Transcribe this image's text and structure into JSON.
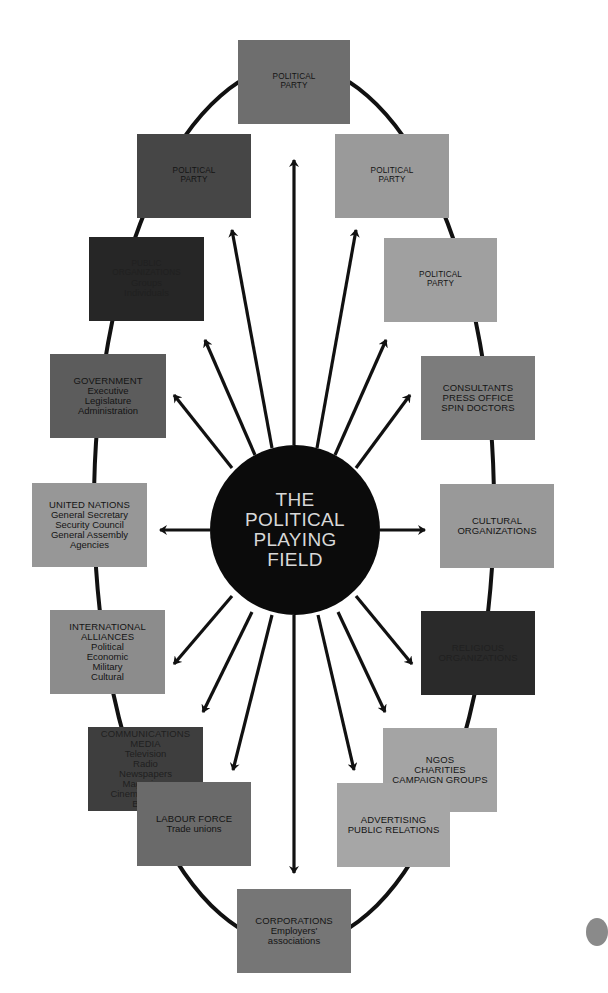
{
  "diagram": {
    "title_lines": [
      "THE",
      "POLITICAL",
      "PLAYING",
      "FIELD"
    ],
    "colors": {
      "background": "#ffffff",
      "hub": "#0b0b0b",
      "hub_text": "#d8d8d8",
      "connector": "#111111"
    },
    "nodes": [
      {
        "id": "political-party-top",
        "title": [
          "POLITICAL",
          "PARTY"
        ],
        "sub": [],
        "fill": "#6e6e6e",
        "x": 238,
        "y": 40,
        "w": 112,
        "h": 84,
        "small": true
      },
      {
        "id": "political-party-upper-left",
        "title": [
          "POLITICAL",
          "PARTY"
        ],
        "sub": [],
        "fill": "#464646",
        "x": 137,
        "y": 134,
        "w": 114,
        "h": 84,
        "small": true
      },
      {
        "id": "political-party-upper-right",
        "title": [
          "POLITICAL",
          "PARTY"
        ],
        "sub": [],
        "fill": "#9a9a9a",
        "x": 335,
        "y": 134,
        "w": 114,
        "h": 84,
        "small": true
      },
      {
        "id": "public-organizations",
        "title": [
          "PUBLIC",
          "ORGANIZATIONS"
        ],
        "sub": [
          "Groups",
          "Individuals"
        ],
        "fill": "#262626",
        "x": 89,
        "y": 237,
        "w": 115,
        "h": 84,
        "small": true,
        "dark": true
      },
      {
        "id": "political-party-right",
        "title": [
          "POLITICAL",
          "PARTY"
        ],
        "sub": [],
        "fill": "#a0a0a0",
        "x": 384,
        "y": 238,
        "w": 113,
        "h": 84,
        "small": true
      },
      {
        "id": "government",
        "title": [
          "GOVERNMENT"
        ],
        "sub": [
          "Executive",
          "Legislature",
          "Administration"
        ],
        "fill": "#5c5c5c",
        "x": 50,
        "y": 354,
        "w": 116,
        "h": 84
      },
      {
        "id": "consultants",
        "title": [
          "CONSULTANTS",
          "PRESS OFFICE",
          "SPIN DOCTORS"
        ],
        "sub": [],
        "fill": "#7c7c7c",
        "x": 421,
        "y": 356,
        "w": 114,
        "h": 84
      },
      {
        "id": "united-nations",
        "title": [
          "UNITED NATIONS"
        ],
        "sub": [
          "General Secretary",
          "Security Council",
          "General Assembly",
          "Agencies"
        ],
        "fill": "#979797",
        "x": 32,
        "y": 483,
        "w": 115,
        "h": 84
      },
      {
        "id": "cultural-organizations",
        "title": [
          "CULTURAL",
          "ORGANIZATIONS"
        ],
        "sub": [],
        "fill": "#999999",
        "x": 440,
        "y": 484,
        "w": 114,
        "h": 84
      },
      {
        "id": "international-alliances",
        "title": [
          "INTERNATIONAL",
          "ALLIANCES"
        ],
        "sub": [
          "Political",
          "Economic",
          "Military",
          "Cultural"
        ],
        "fill": "#8c8c8c",
        "x": 50,
        "y": 610,
        "w": 115,
        "h": 84
      },
      {
        "id": "religious-organizations",
        "title": [
          "RELIGIOUS",
          "ORGANIZATIONS"
        ],
        "sub": [],
        "fill": "#2a2a2a",
        "x": 421,
        "y": 611,
        "w": 114,
        "h": 84,
        "dark": true
      },
      {
        "id": "communications-media",
        "title": [
          "COMMUNICATIONS",
          "MEDIA"
        ],
        "sub": [
          "Television",
          "Radio",
          "Newspapers",
          "Magazines",
          "Cinema, Internet",
          "Books"
        ],
        "fill": "#3e3e3e",
        "x": 88,
        "y": 727,
        "w": 115,
        "h": 84,
        "dark": true
      },
      {
        "id": "ngos",
        "title": [
          "NGOs",
          "CHARITIES",
          "CAMPAIGN GROUPS"
        ],
        "sub": [],
        "fill": "#a4a4a4",
        "x": 383,
        "y": 728,
        "w": 114,
        "h": 84
      },
      {
        "id": "labour-force",
        "title": [
          "LABOUR FORCE"
        ],
        "sub": [
          "Trade unions"
        ],
        "fill": "#6a6a6a",
        "x": 137,
        "y": 782,
        "w": 114,
        "h": 84
      },
      {
        "id": "advertising",
        "title": [
          "ADVERTISING",
          "PUBLIC RELATIONS"
        ],
        "sub": [],
        "fill": "#a6a6a6",
        "x": 337,
        "y": 783,
        "w": 113,
        "h": 84
      },
      {
        "id": "corporations",
        "title": [
          "CORPORATIONS"
        ],
        "sub": [
          "Employers'",
          "associations"
        ],
        "fill": "#767676",
        "x": 237,
        "y": 889,
        "w": 114,
        "h": 84
      }
    ],
    "hub": {
      "cx": 295,
      "cy": 530,
      "r": 85
    },
    "arrows": [
      {
        "to": "political-party-top",
        "x1": 294,
        "y1": 445,
        "x2": 294,
        "y2": 160
      },
      {
        "to": "political-party-upper-left",
        "x1": 272,
        "y1": 448,
        "x2": 232,
        "y2": 230
      },
      {
        "to": "political-party-upper-right",
        "x1": 317,
        "y1": 448,
        "x2": 356,
        "y2": 230
      },
      {
        "to": "public-organizations",
        "x1": 255,
        "y1": 455,
        "x2": 205,
        "y2": 340
      },
      {
        "to": "political-party-right",
        "x1": 335,
        "y1": 455,
        "x2": 386,
        "y2": 340
      },
      {
        "to": "government",
        "x1": 232,
        "y1": 468,
        "x2": 174,
        "y2": 395
      },
      {
        "to": "consultants",
        "x1": 356,
        "y1": 468,
        "x2": 410,
        "y2": 395
      },
      {
        "to": "united-nations",
        "x1": 210,
        "y1": 530,
        "x2": 160,
        "y2": 530
      },
      {
        "to": "cultural-organizations",
        "x1": 380,
        "y1": 530,
        "x2": 425,
        "y2": 530
      },
      {
        "to": "international-alliances",
        "x1": 232,
        "y1": 596,
        "x2": 174,
        "y2": 664
      },
      {
        "to": "religious-organizations",
        "x1": 356,
        "y1": 596,
        "x2": 412,
        "y2": 664
      },
      {
        "to": "communications-media",
        "x1": 252,
        "y1": 612,
        "x2": 203,
        "y2": 712
      },
      {
        "to": "ngos",
        "x1": 338,
        "y1": 612,
        "x2": 385,
        "y2": 712
      },
      {
        "to": "labour-force",
        "x1": 272,
        "y1": 615,
        "x2": 233,
        "y2": 770
      },
      {
        "to": "advertising",
        "x1": 318,
        "y1": 615,
        "x2": 354,
        "y2": 770
      },
      {
        "to": "corporations",
        "x1": 294,
        "y1": 615,
        "x2": 294,
        "y2": 873
      }
    ],
    "ring": {
      "cx": 294,
      "cy": 505,
      "rx": 200,
      "ry": 440
    }
  },
  "page_tab": {
    "fill": "#8a8a8a"
  }
}
